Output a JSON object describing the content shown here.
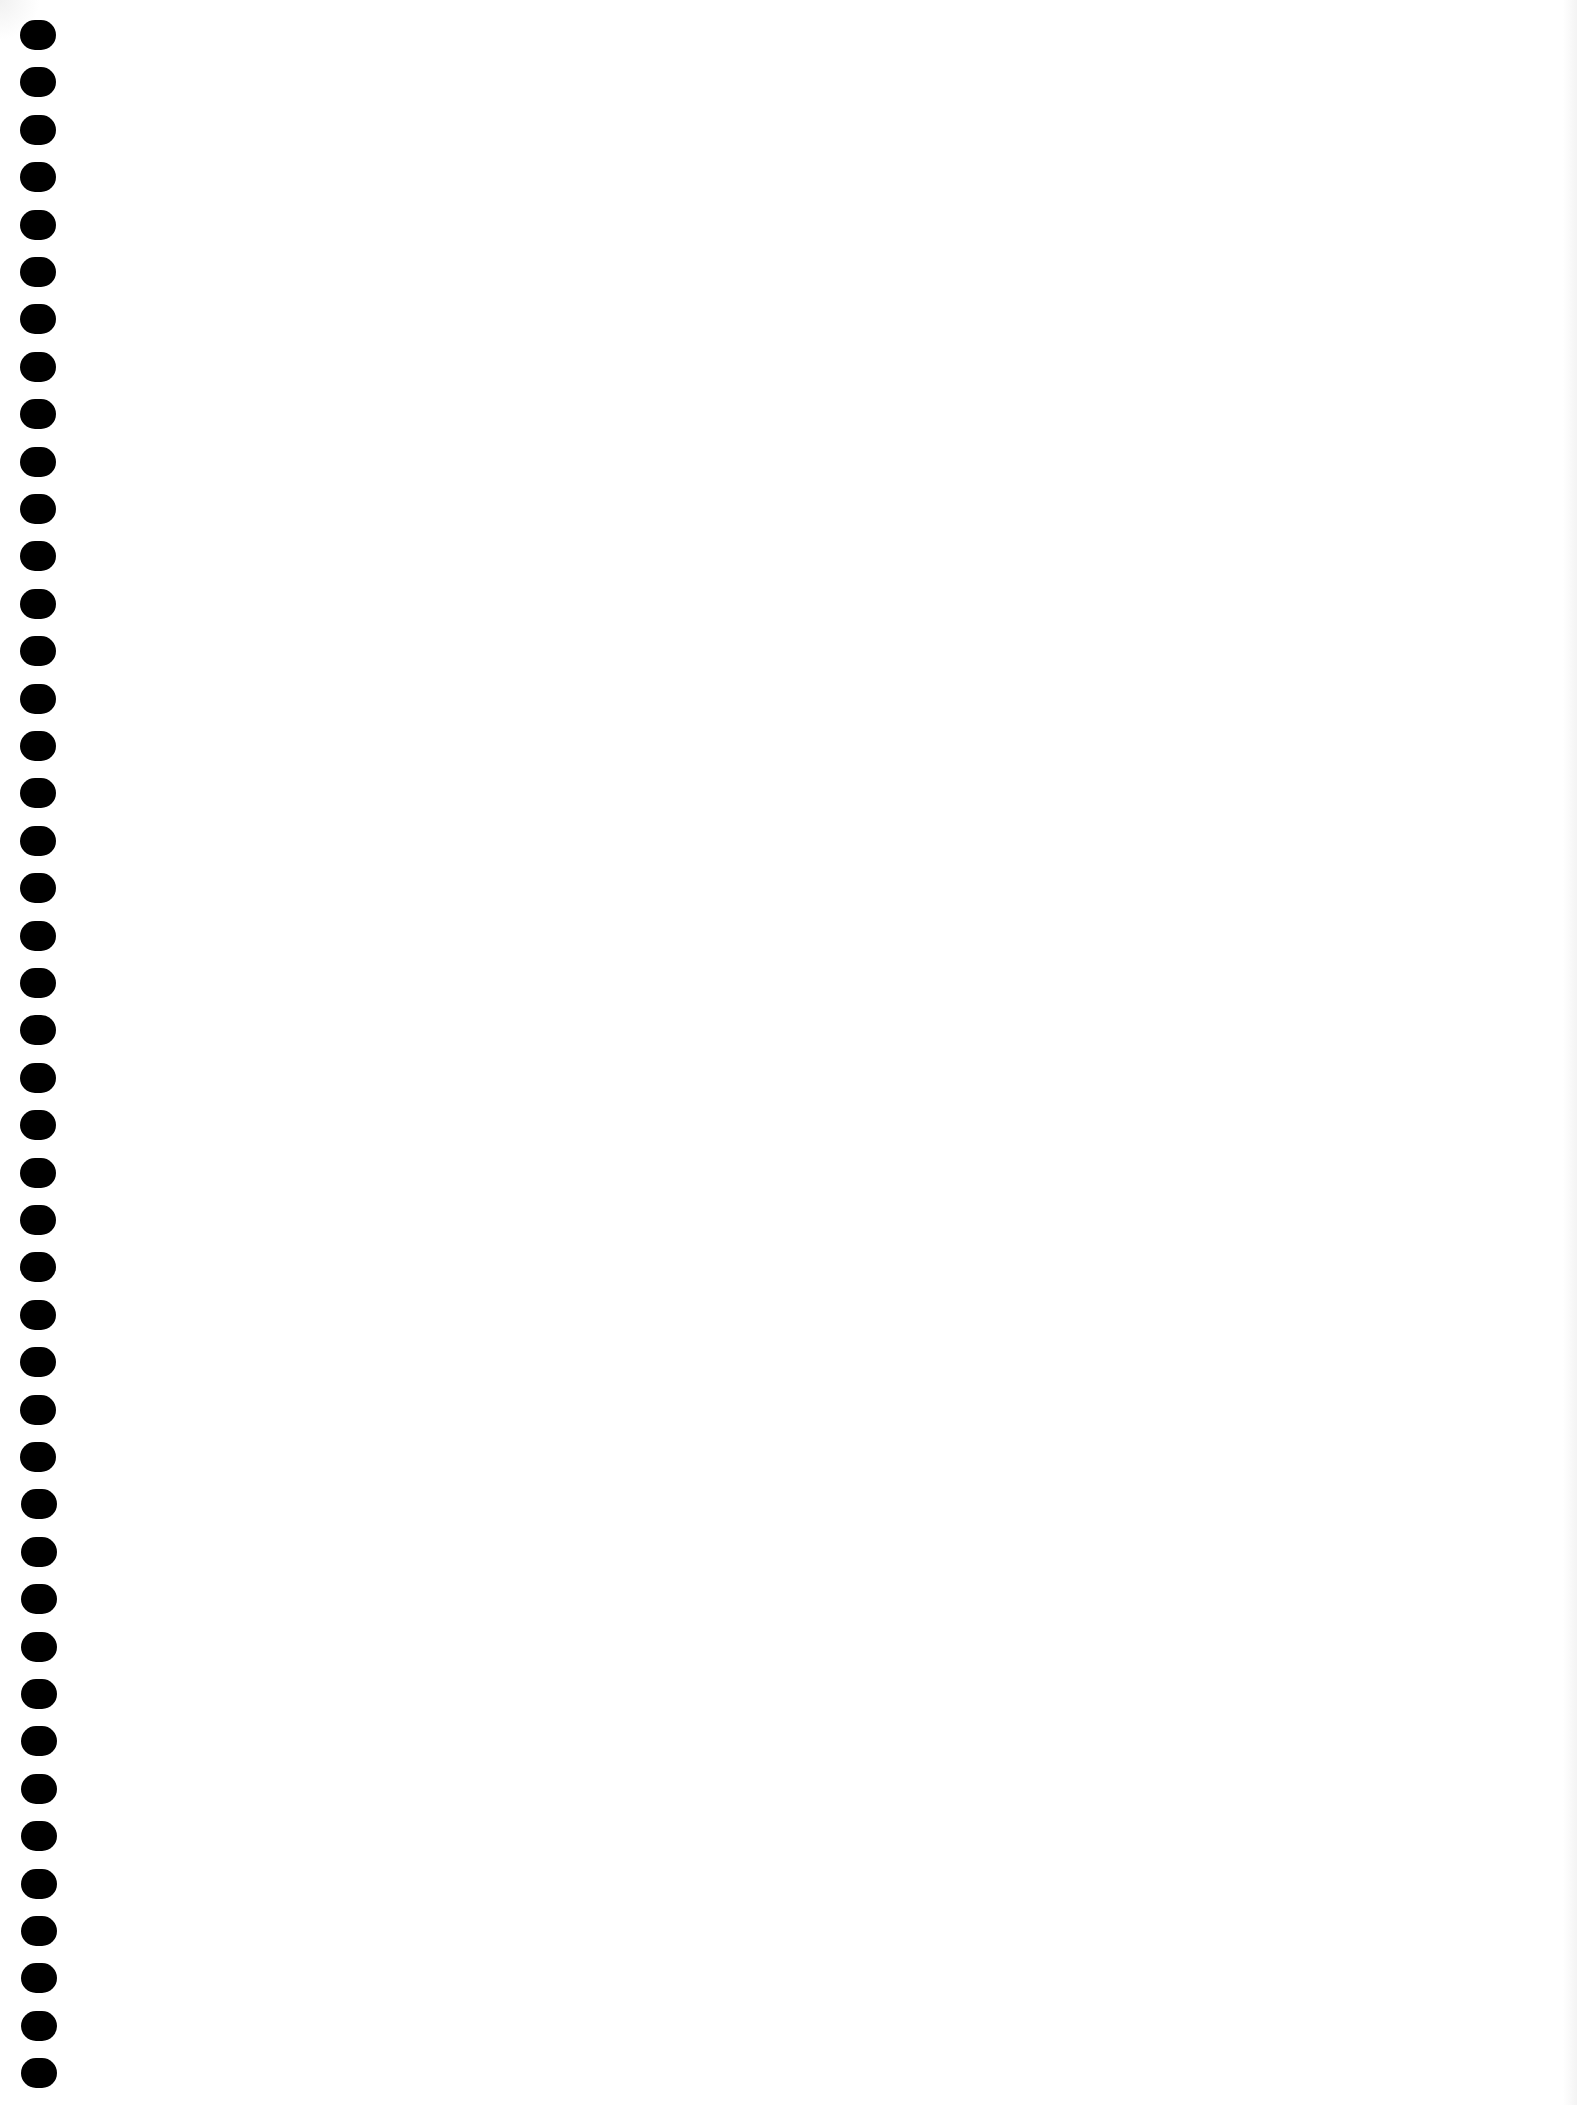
{
  "document": {
    "type": "blank notebook page",
    "background_color": "#ffffff",
    "binding": {
      "side": "left",
      "hole_count": 44,
      "hole_color": "#000000",
      "first_hole_top": 20,
      "hole_spacing": 47.4,
      "hole_left": 20,
      "hole_width": 36,
      "hole_height": 30
    },
    "text_content": []
  }
}
